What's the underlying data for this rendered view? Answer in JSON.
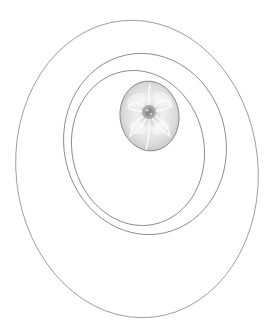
{
  "canvas": {
    "width": 278,
    "height": 335,
    "background": "#ffffff"
  },
  "colors": {
    "stroke": "#8a8a8a",
    "flower_light": "#f2f2f2",
    "flower_mid": "#c9c9c9",
    "flower_dark": "#8c8c8c"
  },
  "shapes": {
    "outer_ellipse": {
      "label": "outer-ring"
    },
    "middle_ellipse": {
      "label": "middle-ring"
    },
    "inner_ellipse": {
      "label": "inner-ring"
    },
    "flower_oval": {
      "label": "flower-photo",
      "description": "grayscale rose/lotus flower photo cropped in oval"
    }
  }
}
